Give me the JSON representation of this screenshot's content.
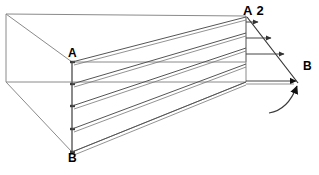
{
  "figure": {
    "title_fragment": "",
    "type": "3d-prism-pressure-distribution-diagram",
    "background_color": "#ffffff",
    "line_color": "#555555",
    "dark_line_color": "#222222",
    "label_color": "#000000",
    "labels": {
      "a": "A",
      "a2": "A 2",
      "b_right": "B",
      "b_bottom": "B"
    },
    "geometry": {
      "box": {
        "top_left": [
          6,
          14
        ],
        "top_right": [
          246,
          16
        ],
        "front_top_left": [
          72,
          62
        ],
        "front_top_right": [
          246,
          62
        ],
        "bottom_left": [
          6,
          82
        ],
        "bottom_right": [
          246,
          82
        ],
        "front_bottom": [
          72,
          152
        ]
      },
      "vertical_axis_ab": {
        "from": [
          72,
          62
        ],
        "to": [
          72,
          152
        ]
      },
      "right_edge": {
        "from": [
          246,
          16
        ],
        "to": [
          246,
          82
        ]
      },
      "fan_diagonal": {
        "from": [
          247,
          17
        ],
        "to": [
          297,
          83
        ]
      },
      "fan_rows_y": [
        22,
        38,
        54,
        82
      ],
      "ray_origins_y": [
        62,
        84,
        106,
        129,
        152
      ],
      "ray_targets_y": [
        17,
        33,
        48,
        64,
        82
      ],
      "curved_arrow": {
        "from": [
          276,
          110
        ],
        "to": [
          299,
          85
        ]
      }
    }
  }
}
